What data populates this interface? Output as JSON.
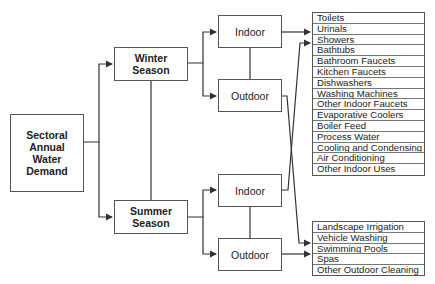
{
  "diagram": {
    "root": {
      "label": "Sectoral Annual Water Demand",
      "lines": [
        "Sectoral",
        "Annual",
        "Water",
        "Demand"
      ]
    },
    "seasons": [
      {
        "label": "Winter Season",
        "lines": [
          "Winter",
          "Season"
        ]
      },
      {
        "label": "Summer Season",
        "lines": [
          "Summer",
          "Season"
        ]
      }
    ],
    "uses": {
      "winter_indoor": "Indoor",
      "winter_outdoor": "Outdoor",
      "summer_indoor": "Indoor",
      "summer_outdoor": "Outdoor"
    },
    "indoor_categories": [
      "Toilets",
      "Urinals",
      "Showers",
      "Bathtubs",
      "Bathroom Faucets",
      "Kitchen Faucets",
      "Dishwashers",
      "Washing Machines",
      "Other Indoor Faucets",
      "Evaporative Coolers",
      "Boiler Feed",
      "Process Water",
      "Cooling and Condensing",
      "Air Conditioning",
      "Other Indoor Uses"
    ],
    "outdoor_categories": [
      "Landscape Irrigation",
      "Vehicle Washing",
      "Swimming Pools",
      "Spas",
      "Other Outdoor Cleaning"
    ]
  }
}
